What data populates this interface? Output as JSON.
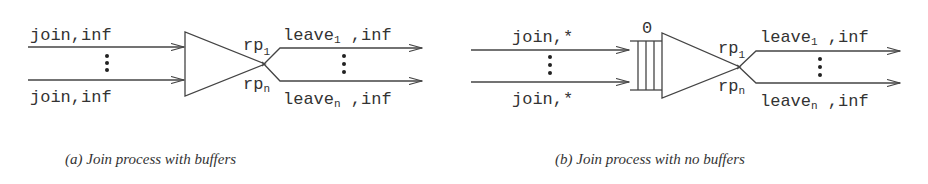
{
  "panel_a": {
    "inputs": [
      {
        "label": "join,inf"
      },
      {
        "label": "join,inf"
      }
    ],
    "ports": {
      "top": "rp",
      "top_sub": "1",
      "bottom": "rp",
      "bottom_sub": "n"
    },
    "outputs": [
      {
        "label": "leave",
        "sub": "1",
        "suffix": " ,inf"
      },
      {
        "label": "leave",
        "sub": "n",
        "suffix": " ,inf"
      }
    ],
    "caption": "(a) Join process with buffers"
  },
  "panel_b": {
    "inputs": [
      {
        "label": "join,*"
      },
      {
        "label": "join,*"
      }
    ],
    "buffer_label": "0",
    "ports": {
      "top": "rp",
      "top_sub": "1",
      "bottom": "rp",
      "bottom_sub": "n"
    },
    "outputs": [
      {
        "label": "leave",
        "sub": "1",
        "suffix": " ,inf"
      },
      {
        "label": "leave",
        "sub": "n",
        "suffix": " ,inf"
      }
    ],
    "caption": "(b) Join process with no buffers"
  },
  "colors": {
    "stroke": "#444444",
    "text": "#333333",
    "background": "#ffffff"
  }
}
